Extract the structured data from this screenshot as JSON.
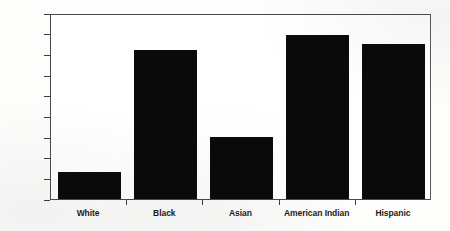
{
  "chart_data": {
    "type": "bar",
    "title": "",
    "xlabel": "",
    "ylabel": "Percentage",
    "categories": [
      "White",
      "Black",
      "Asian",
      "American Indian",
      "Hispanic"
    ],
    "values": [
      6.5,
      36,
      15,
      39.7,
      37.5
    ],
    "ylim": [
      0,
      45
    ],
    "yticks": [
      0,
      5,
      10,
      15,
      20,
      25,
      30,
      35,
      40,
      45
    ],
    "ytick_labels": [
      "0",
      "5",
      "10",
      "15",
      "20",
      "25",
      "30",
      "35",
      "40",
      "45"
    ],
    "grid": false,
    "legend": false,
    "bar_color": "#0a0a0a",
    "frame_color": "#4a4a4a",
    "background_color": "#ffffff"
  }
}
